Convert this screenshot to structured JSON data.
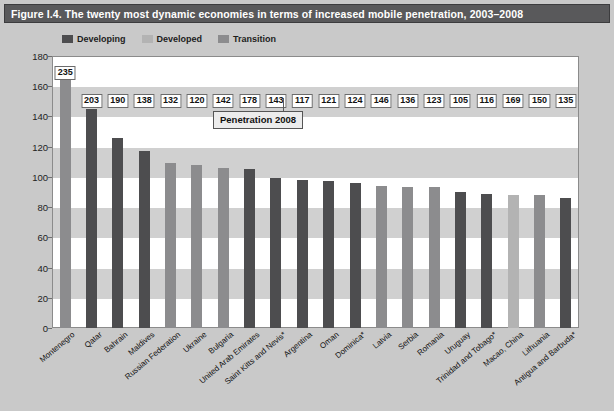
{
  "figure": {
    "title": "Figure I.4. The twenty most dynamic economies in terms of increased mobile penetration, 2003–2008"
  },
  "callout": {
    "label": "Penetration 2008"
  },
  "colors": {
    "developing": "#4d4d4f",
    "developed": "#b3b3b3",
    "transition": "#8c8c8e",
    "title_bar": "#59595b",
    "page_background": "#c9c9c9",
    "plot_background": "#ffffff",
    "band": "#d0d0d0",
    "axis": "#8b8b8b"
  },
  "chart_data": {
    "type": "bar",
    "title": "Figure I.4. The twenty most dynamic economies in terms of increased mobile penetration, 2003–2008",
    "xlabel": "",
    "ylabel": "",
    "ylim": [
      0,
      180
    ],
    "yticks": [
      0,
      20,
      40,
      60,
      80,
      100,
      120,
      140,
      160,
      180
    ],
    "ytick_labels": [
      "0",
      "20",
      "40",
      "60",
      "80",
      "100",
      "120",
      "140",
      "160",
      "180"
    ],
    "grid": "horizontal-bands",
    "legend_position": "top-left",
    "legend": [
      {
        "name": "Developing",
        "color": "#4d4d4f"
      },
      {
        "name": "Developed",
        "color": "#b3b3b3"
      },
      {
        "name": "Transition",
        "color": "#8c8c8e"
      }
    ],
    "categories": [
      "Montenegro",
      "Qatar",
      "Bahrain",
      "Maldives",
      "Russian Federation",
      "Ukraine",
      "Bulgaria",
      "United Arab Emirates",
      "Saint Kitts and Nevis*",
      "Argentina",
      "Oman",
      "Dominica*",
      "Latvia",
      "Serbia",
      "Romania",
      "Uruguay",
      "Trinidad and Tobago*",
      "Macao, China",
      "Lithuania",
      "Antigua and Barbuda*"
    ],
    "values": [
      170,
      145,
      126,
      117,
      109,
      108,
      106,
      105,
      99,
      98,
      97,
      96,
      94,
      93,
      93,
      90,
      89,
      88,
      88,
      86
    ],
    "series_group": [
      "transition",
      "developing",
      "developing",
      "developing",
      "transition",
      "transition",
      "transition",
      "developing",
      "developing",
      "developing",
      "developing",
      "developing",
      "transition",
      "transition",
      "transition",
      "developing",
      "developing",
      "developed",
      "transition",
      "developing"
    ],
    "data_labels": [
      235,
      203,
      190,
      138,
      132,
      120,
      142,
      178,
      143,
      117,
      121,
      124,
      146,
      136,
      123,
      105,
      116,
      169,
      150,
      135
    ],
    "data_labels_meaning": "Penetration 2008"
  }
}
